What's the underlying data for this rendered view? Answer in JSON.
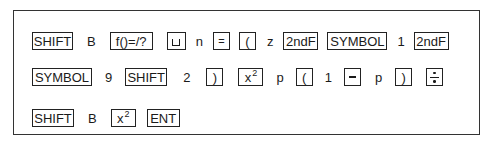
{
  "sequence": {
    "rows": [
      {
        "items": [
          {
            "type": "key",
            "label": "SHIFT"
          },
          {
            "type": "text",
            "label": "B"
          },
          {
            "type": "key",
            "label": "f()=/?"
          },
          {
            "type": "key",
            "icon": "space-icon",
            "label": ""
          },
          {
            "type": "text",
            "label": "n"
          },
          {
            "type": "key",
            "label": "="
          },
          {
            "type": "key",
            "label": "("
          },
          {
            "type": "text",
            "label": "z"
          },
          {
            "type": "key",
            "label": "2ndF"
          },
          {
            "type": "key",
            "label": "SYMBOL"
          },
          {
            "type": "text",
            "label": "1"
          },
          {
            "type": "key",
            "label": "2ndF"
          }
        ]
      },
      {
        "items": [
          {
            "type": "key",
            "label": "SYMBOL"
          },
          {
            "type": "text",
            "label": "9"
          },
          {
            "type": "key",
            "label": "SHIFT"
          },
          {
            "type": "text",
            "label": "2"
          },
          {
            "type": "key",
            "label": ")"
          },
          {
            "type": "key",
            "label": "x",
            "superscript": "2"
          },
          {
            "type": "text",
            "label": "p"
          },
          {
            "type": "key",
            "label": "("
          },
          {
            "type": "text",
            "label": "1"
          },
          {
            "type": "key",
            "icon": "minus-icon",
            "label": "−"
          },
          {
            "type": "text",
            "label": "p"
          },
          {
            "type": "key",
            "label": ")"
          },
          {
            "type": "key",
            "icon": "divide-icon",
            "label": "÷"
          }
        ]
      },
      {
        "items": [
          {
            "type": "key",
            "label": "SHIFT"
          },
          {
            "type": "text",
            "label": "B"
          },
          {
            "type": "key",
            "label": "x",
            "superscript": "2"
          },
          {
            "type": "key",
            "label": "ENT"
          }
        ]
      }
    ]
  }
}
